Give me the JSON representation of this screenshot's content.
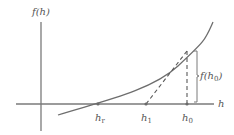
{
  "diagram": {
    "y_axis_label": "f(h)",
    "x_axis_label": "h",
    "points": [
      {
        "id": "hr",
        "label_base": "h",
        "label_sub": "r"
      },
      {
        "id": "h1",
        "label_base": "h",
        "label_sub": "1"
      },
      {
        "id": "h0",
        "label_base": "h",
        "label_sub": "0"
      }
    ],
    "brace_label": {
      "prefix": "f(h",
      "sub": "0",
      "suffix": ")"
    },
    "colors": {
      "axis": "#7a7a7a",
      "curve": "#6e6e6e",
      "dashed": "#5a5a5a",
      "text": "#555555"
    }
  }
}
